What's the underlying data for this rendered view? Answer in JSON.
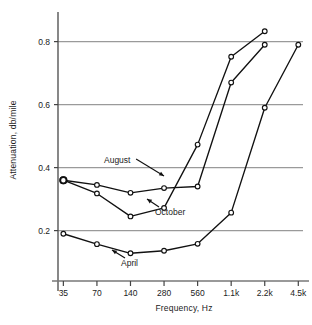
{
  "chart_data": {
    "type": "line",
    "title": "",
    "xlabel": "Frequency, Hz",
    "ylabel": "Attenuation, db/mile",
    "x_tick_labels": [
      "35",
      "70",
      "140",
      "280",
      "560",
      "1.1k",
      "2.2k",
      "4.5k"
    ],
    "x_scale": "log-categorical",
    "y_tick_labels": [
      "0.2",
      "0.4",
      "0.6",
      "0.8"
    ],
    "y_ticks": [
      0.2,
      0.4,
      0.6,
      0.8
    ],
    "ylim": [
      0.04,
      0.875
    ],
    "grid": "horizontal",
    "legend": "inline-annotations",
    "marker": "open-circle",
    "line_color": "#111111",
    "grid_color": "#9a9a9a",
    "series": [
      {
        "name": "August",
        "x": [
          "35",
          "70",
          "140",
          "280",
          "560",
          "1.1k",
          "2.2k"
        ],
        "values": [
          0.36,
          0.345,
          0.32,
          0.335,
          0.34,
          0.67,
          0.79
        ]
      },
      {
        "name": "October",
        "x": [
          "35",
          "70",
          "140",
          "280",
          "560",
          "1.1k",
          "2.2k"
        ],
        "values": [
          0.36,
          0.318,
          0.245,
          0.272,
          0.473,
          0.752,
          0.833
        ]
      },
      {
        "name": "April",
        "x": [
          "35",
          "70",
          "140",
          "280",
          "560",
          "1.1k",
          "2.2k",
          "4.5k"
        ],
        "values": [
          0.19,
          0.157,
          0.128,
          0.136,
          0.158,
          0.257,
          0.59,
          0.79
        ]
      }
    ],
    "annotations": [
      {
        "label": "August",
        "text_x": 104,
        "text_y": 163,
        "arrow_to_x": 164,
        "arrow_to_y": 176
      },
      {
        "label": "October",
        "text_x": 155,
        "text_y": 215,
        "arrow_to_x": 147,
        "arrow_to_y": 199
      },
      {
        "label": "April",
        "text_x": 121,
        "text_y": 266,
        "arrow_to_x": 112,
        "arrow_to_y": 250
      }
    ]
  }
}
